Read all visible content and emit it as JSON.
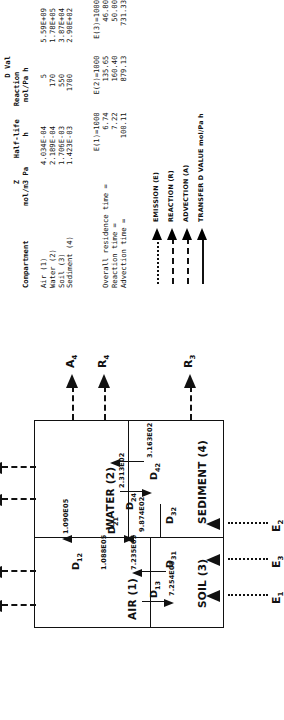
{
  "figure": {
    "kind": "level-iii-fugacity-multimedia-mass-balance-diagram"
  },
  "table": {
    "title_right": "D Val",
    "header_lines": [
      "                      Bulk",
      "                        Z     Half-life   Reaction",
      "Compartment        mol/m3 Pa       h       mol/Pa h"
    ],
    "columns": [
      "Compartment",
      "Bulk Z mol/m3 Pa",
      "Half-life h",
      "Reaction mol/Pa h"
    ],
    "rows": [
      {
        "compartment": "Air (1)",
        "bulk_z": "4.034E-04",
        "half_life": "5",
        "reaction": "5.59E+09"
      },
      {
        "compartment": "Water (2)",
        "bulk_z": "2.189E-04",
        "half_life": "170",
        "reaction": "1.78E+05"
      },
      {
        "compartment": "Soil (3)",
        "bulk_z": "1.706E-03",
        "half_life": "550",
        "reaction": "3.87E+04"
      },
      {
        "compartment": "Sediment (4)",
        "bulk_z": "1.423E-03",
        "half_life": "1700",
        "reaction": "2.90E+02"
      }
    ],
    "summary": {
      "case_headers": [
        "E(1)=1000",
        "E(2)=1000",
        "E(3)=1000"
      ],
      "rows": [
        {
          "label": "Overall residence time =",
          "values": [
            "6.74",
            "135.65",
            "46.80"
          ]
        },
        {
          "label": "Reaction time =",
          "values": [
            "7.22",
            "160.40",
            "50.00"
          ]
        },
        {
          "label": "Advection time =",
          "values": [
            "100.11",
            "879.13",
            "731.33"
          ]
        }
      ]
    }
  },
  "legend": {
    "items": [
      {
        "name": "emission",
        "label": "EMISSION (E)",
        "style": "dotted"
      },
      {
        "name": "reaction",
        "label": "REACTION (R)",
        "style": "dashed"
      },
      {
        "name": "advection",
        "label": "ADVECTION (A)",
        "style": "dash-dot"
      },
      {
        "name": "transfer",
        "label": "TRANSFER D VALUE mol/Pa h",
        "style": "solid"
      }
    ]
  },
  "diagram": {
    "compartments": [
      {
        "id": "air",
        "label": "AIR (1)"
      },
      {
        "id": "water",
        "label": "WATER (2)"
      },
      {
        "id": "soil",
        "label": "SOIL (3)"
      },
      {
        "id": "sediment",
        "label": "SEDIMENT (4)"
      }
    ],
    "transfers": [
      {
        "id": "D12",
        "label": "D",
        "sub": "12",
        "value": "1.090E05"
      },
      {
        "id": "D21",
        "label": "D",
        "sub": "21",
        "value": "1.088E05"
      },
      {
        "id": "D13",
        "label": "D",
        "sub": "13",
        "value": "7.254E05"
      },
      {
        "id": "D31",
        "label": "D",
        "sub": "31",
        "value": "7.235E05"
      },
      {
        "id": "D24",
        "label": "D",
        "sub": "24",
        "value": "2.313E02"
      },
      {
        "id": "D42",
        "label": "D",
        "sub": "42",
        "value": "3.163E02"
      },
      {
        "id": "D32",
        "label": "D",
        "sub": "32",
        "value": "9.874E02"
      }
    ],
    "emissions": [
      {
        "id": "E1",
        "label": "E",
        "sub": "1"
      },
      {
        "id": "E2",
        "label": "E",
        "sub": "2"
      },
      {
        "id": "E3",
        "label": "E",
        "sub": "3"
      }
    ],
    "reactions": [
      {
        "id": "R1",
        "label": "R",
        "sub": "1"
      },
      {
        "id": "R2",
        "label": "R",
        "sub": "2"
      },
      {
        "id": "R3",
        "label": "R",
        "sub": "3"
      },
      {
        "id": "R4",
        "label": "R",
        "sub": "4"
      }
    ],
    "advections": [
      {
        "id": "A1",
        "label": "A",
        "sub": "1"
      },
      {
        "id": "A2",
        "label": "A",
        "sub": "2"
      },
      {
        "id": "A4",
        "label": "A",
        "sub": "4"
      }
    ]
  },
  "colors": {
    "ink": "#111111",
    "paper": "#ffffff"
  }
}
